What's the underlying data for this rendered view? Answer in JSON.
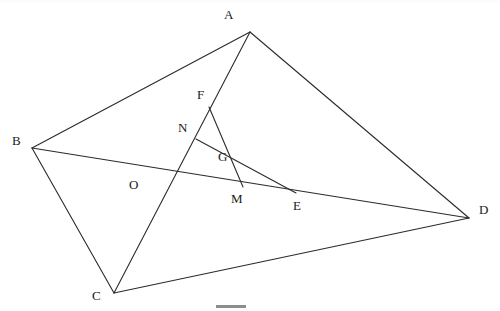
{
  "figure": {
    "stroke_color": "#2b2b2b",
    "label_color": "#1a1a1a",
    "background_color": "#ffffff",
    "width": 500,
    "height": 311,
    "points": [
      {
        "id": "A",
        "label": "A",
        "x": 250,
        "y": 32,
        "label_x": 224,
        "label_y": 8,
        "kind": "vertex"
      },
      {
        "id": "B",
        "label": "B",
        "x": 32,
        "y": 148,
        "label_x": 12,
        "label_y": 134,
        "kind": "vertex"
      },
      {
        "id": "C",
        "label": "C",
        "x": 114,
        "y": 293,
        "label_x": 92,
        "label_y": 289,
        "kind": "vertex"
      },
      {
        "id": "D",
        "label": "D",
        "x": 469,
        "y": 218,
        "label_x": 479,
        "label_y": 203,
        "kind": "vertex"
      },
      {
        "id": "F",
        "label": "F",
        "x": 209,
        "y": 107,
        "label_x": 197,
        "label_y": 88,
        "kind": "point"
      },
      {
        "id": "N",
        "label": "N",
        "x": 196,
        "y": 139,
        "label_x": 178,
        "label_y": 121,
        "kind": "point"
      },
      {
        "id": "G",
        "label": "G",
        "x": 232,
        "y": 163,
        "label_x": 218,
        "label_y": 150,
        "kind": "intersection"
      },
      {
        "id": "M",
        "label": "M",
        "x": 243,
        "y": 187,
        "label_x": 231,
        "label_y": 192,
        "kind": "point"
      },
      {
        "id": "E",
        "label": "E",
        "x": 296,
        "y": 193,
        "label_x": 293,
        "label_y": 199,
        "kind": "point"
      },
      {
        "id": "O",
        "label": "O",
        "x": 176,
        "y": 172,
        "label_x": 129,
        "label_y": 178,
        "kind": "intersection"
      }
    ],
    "segments": [
      {
        "id": "AB",
        "from": "A",
        "to": "B",
        "name": "segment-ab"
      },
      {
        "id": "AD",
        "from": "A",
        "to": "D",
        "name": "segment-ad"
      },
      {
        "id": "BC",
        "from": "B",
        "to": "C",
        "name": "segment-bc"
      },
      {
        "id": "CD",
        "from": "C",
        "to": "D",
        "name": "segment-cd"
      },
      {
        "id": "AC",
        "from": "A",
        "to": "C",
        "name": "diagonal-ac"
      },
      {
        "id": "BD",
        "from": "B",
        "to": "D",
        "name": "diagonal-bd"
      },
      {
        "id": "FM",
        "from": "F",
        "to": "M",
        "name": "segment-fm"
      },
      {
        "id": "NE",
        "from": "N",
        "to": "E",
        "name": "segment-ne"
      }
    ],
    "bottom_mark": {
      "x": 216,
      "y": 305,
      "width": 30,
      "height": 3
    },
    "notes": {
      "ac_passes_through": [
        "F",
        "N",
        "O"
      ],
      "bd_passes_through": [
        "O",
        "M",
        "E"
      ],
      "fm_ne_intersection": "G"
    }
  }
}
